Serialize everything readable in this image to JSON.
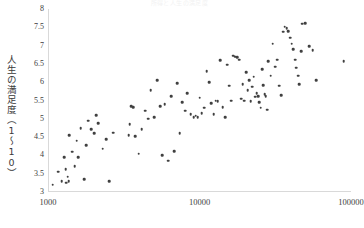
{
  "chart_data": {
    "type": "scatter",
    "title": "所得と人生の満足度",
    "xlabel": "",
    "ylabel": "人生の満足度（1〜10）",
    "xscale": "log",
    "yscale": "linear",
    "xlim": [
      1000,
      100000
    ],
    "ylim": [
      3,
      8
    ],
    "xticks": [
      1000,
      10000,
      100000
    ],
    "xtick_labels": [
      "1000",
      "10000",
      "100000"
    ],
    "yticks": [
      3,
      3.5,
      4,
      4.5,
      5,
      5.5,
      6,
      6.5,
      7,
      7.5,
      8
    ],
    "ytick_labels": [
      "3",
      "3.5",
      "4",
      "4.5",
      "5",
      "5.5",
      "6",
      "6.5",
      "7",
      "7.5",
      "8"
    ],
    "grid": false,
    "legend": null,
    "marker_color": "#404040",
    "axis_color": "#d9d9d9",
    "series": [
      {
        "name": "国",
        "points": [
          [
            1060,
            3.2
          ],
          [
            1150,
            3.55
          ],
          [
            1210,
            3.3
          ],
          [
            1260,
            3.95
          ],
          [
            1290,
            3.62
          ],
          [
            1300,
            3.25
          ],
          [
            1330,
            3.42
          ],
          [
            1350,
            3.3
          ],
          [
            1360,
            4.55
          ],
          [
            1420,
            4.1
          ],
          [
            1480,
            3.7
          ],
          [
            1520,
            4.4
          ],
          [
            1560,
            3.95
          ],
          [
            1620,
            4.75
          ],
          [
            1700,
            3.35
          ],
          [
            1760,
            4.28
          ],
          [
            1810,
            4.95
          ],
          [
            1900,
            4.72
          ],
          [
            1980,
            4.6
          ],
          [
            2040,
            5.1
          ],
          [
            2120,
            4.88
          ],
          [
            2260,
            4.18
          ],
          [
            2380,
            4.45
          ],
          [
            2500,
            3.3
          ],
          [
            2650,
            4.62
          ],
          [
            3350,
            4.55
          ],
          [
            3400,
            4.85
          ],
          [
            3500,
            5.35
          ],
          [
            3580,
            5.32
          ],
          [
            3700,
            4.52
          ],
          [
            3900,
            4.05
          ],
          [
            4100,
            4.72
          ],
          [
            4300,
            5.22
          ],
          [
            4500,
            5.0
          ],
          [
            4700,
            5.78
          ],
          [
            4950,
            5.05
          ],
          [
            5200,
            6.05
          ],
          [
            5400,
            5.35
          ],
          [
            5600,
            4.0
          ],
          [
            5800,
            5.4
          ],
          [
            6100,
            3.85
          ],
          [
            6400,
            5.62
          ],
          [
            6700,
            4.12
          ],
          [
            7000,
            5.98
          ],
          [
            7300,
            4.6
          ],
          [
            7600,
            5.45
          ],
          [
            7900,
            5.22
          ],
          [
            8200,
            5.7
          ],
          [
            8600,
            5.12
          ],
          [
            9000,
            5.05
          ],
          [
            9300,
            5.08
          ],
          [
            9600,
            5.05
          ],
          [
            9900,
            5.58
          ],
          [
            10200,
            5.15
          ],
          [
            10600,
            5.3
          ],
          [
            11000,
            6.3
          ],
          [
            11400,
            6.0
          ],
          [
            11800,
            5.42
          ],
          [
            12200,
            5.12
          ],
          [
            12600,
            5.5
          ],
          [
            13000,
            5.48
          ],
          [
            13500,
            6.6
          ],
          [
            14000,
            5.32
          ],
          [
            14500,
            5.05
          ],
          [
            15000,
            6.48
          ],
          [
            15500,
            5.9
          ],
          [
            16000,
            5.5
          ],
          [
            16500,
            6.72
          ],
          [
            17000,
            6.7
          ],
          [
            17500,
            6.68
          ],
          [
            18000,
            6.62
          ],
          [
            18500,
            5.55
          ],
          [
            19000,
            5.95
          ],
          [
            19500,
            5.5
          ],
          [
            20000,
            6.28
          ],
          [
            20500,
            5.78
          ],
          [
            21000,
            6.05
          ],
          [
            21500,
            5.48
          ],
          [
            22000,
            5.88
          ],
          [
            22500,
            6.15
          ],
          [
            23000,
            5.6
          ],
          [
            23500,
            5.7
          ],
          [
            24000,
            5.62
          ],
          [
            24500,
            5.45
          ],
          [
            25000,
            5.3
          ],
          [
            25500,
            6.35
          ],
          [
            26000,
            5.92
          ],
          [
            26500,
            5.68
          ],
          [
            27000,
            5.62
          ],
          [
            27500,
            5.25
          ],
          [
            28000,
            6.58
          ],
          [
            29000,
            6.18
          ],
          [
            30000,
            7.05
          ],
          [
            31000,
            6.42
          ],
          [
            32000,
            6.62
          ],
          [
            33000,
            5.9
          ],
          [
            34000,
            5.65
          ],
          [
            35000,
            7.38
          ],
          [
            36000,
            7.52
          ],
          [
            37000,
            7.48
          ],
          [
            38000,
            7.4
          ],
          [
            39000,
            7.22
          ],
          [
            40000,
            7.05
          ],
          [
            41000,
            6.9
          ],
          [
            42000,
            6.62
          ],
          [
            43000,
            6.4
          ],
          [
            44000,
            6.18
          ],
          [
            45000,
            5.95
          ],
          [
            46000,
            6.85
          ],
          [
            47000,
            7.6
          ],
          [
            49000,
            7.62
          ],
          [
            52000,
            6.98
          ],
          [
            55000,
            6.88
          ],
          [
            58000,
            6.05
          ],
          [
            88000,
            6.58
          ]
        ]
      }
    ],
    "n_points": 118
  }
}
